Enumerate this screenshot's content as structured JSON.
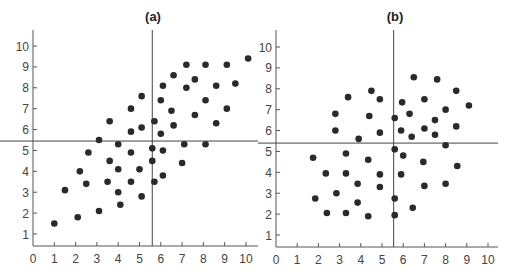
{
  "chart_data": [
    {
      "type": "scatter",
      "title": "(a)",
      "xlabel": "",
      "ylabel": "",
      "xlim": [
        0,
        10
      ],
      "ylim": [
        0.5,
        10.5
      ],
      "x_ticks": [
        0,
        1,
        2,
        3,
        4,
        5,
        6,
        7,
        8,
        9,
        10
      ],
      "y_ticks": [
        1,
        2,
        3,
        4,
        5,
        6,
        7,
        8,
        9,
        10
      ],
      "grid": false,
      "reference_lines": {
        "vertical_x": 5.6,
        "horizontal_y": 5.45
      },
      "marker_color": "#2a2a2a",
      "points": [
        [
          1.0,
          1.5
        ],
        [
          2.1,
          1.8
        ],
        [
          3.1,
          2.1
        ],
        [
          4.1,
          2.4
        ],
        [
          1.5,
          3.1
        ],
        [
          4.0,
          3.0
        ],
        [
          5.1,
          2.8
        ],
        [
          2.2,
          4.0
        ],
        [
          2.5,
          3.4
        ],
        [
          3.5,
          3.5
        ],
        [
          4.6,
          3.5
        ],
        [
          5.7,
          3.5
        ],
        [
          4.0,
          4.1
        ],
        [
          5.0,
          4.1
        ],
        [
          3.6,
          4.5
        ],
        [
          5.6,
          4.5
        ],
        [
          2.6,
          4.9
        ],
        [
          4.6,
          4.9
        ],
        [
          4.0,
          5.3
        ],
        [
          5.6,
          5.1
        ],
        [
          3.1,
          5.5
        ],
        [
          4.6,
          5.9
        ],
        [
          6.0,
          5.8
        ],
        [
          6.1,
          5.0
        ],
        [
          7.1,
          5.3
        ],
        [
          8.1,
          5.3
        ],
        [
          7.0,
          4.4
        ],
        [
          6.1,
          3.8
        ],
        [
          10.1,
          9.4
        ],
        [
          7.2,
          9.1
        ],
        [
          8.1,
          9.1
        ],
        [
          9.1,
          9.1
        ],
        [
          6.6,
          8.6
        ],
        [
          7.6,
          8.4
        ],
        [
          6.1,
          8.1
        ],
        [
          7.2,
          8.0
        ],
        [
          8.6,
          8.1
        ],
        [
          9.5,
          8.2
        ],
        [
          5.1,
          7.6
        ],
        [
          6.0,
          7.4
        ],
        [
          8.1,
          7.4
        ],
        [
          4.6,
          7.0
        ],
        [
          6.5,
          6.9
        ],
        [
          9.1,
          7.0
        ],
        [
          7.6,
          6.7
        ],
        [
          3.6,
          6.4
        ],
        [
          5.7,
          6.4
        ],
        [
          5.1,
          6.1
        ],
        [
          6.6,
          6.2
        ],
        [
          8.6,
          6.3
        ]
      ]
    },
    {
      "type": "scatter",
      "title": "(b)",
      "xlabel": "",
      "ylabel": "",
      "xlim": [
        0,
        10
      ],
      "ylim": [
        0.5,
        10.5
      ],
      "x_ticks": [
        0,
        1,
        2,
        3,
        4,
        5,
        6,
        7,
        8,
        9,
        10
      ],
      "y_ticks": [
        1,
        2,
        3,
        4,
        5,
        6,
        7,
        8,
        9,
        10
      ],
      "grid": false,
      "reference_lines": {
        "vertical_x": 5.55,
        "horizontal_y": 5.4
      },
      "marker_color": "#2a2a2a",
      "points": [
        [
          4.5,
          7.9
        ],
        [
          3.4,
          7.6
        ],
        [
          4.9,
          7.5
        ],
        [
          2.8,
          6.8
        ],
        [
          4.4,
          6.7
        ],
        [
          5.6,
          6.6
        ],
        [
          2.8,
          6.0
        ],
        [
          4.9,
          5.9
        ],
        [
          3.9,
          5.6
        ],
        [
          6.5,
          8.55
        ],
        [
          7.6,
          8.45
        ],
        [
          8.5,
          7.9
        ],
        [
          5.95,
          7.35
        ],
        [
          7.0,
          7.5
        ],
        [
          9.1,
          7.2
        ],
        [
          6.3,
          6.8
        ],
        [
          8.0,
          7.0
        ],
        [
          7.5,
          6.5
        ],
        [
          5.9,
          6.0
        ],
        [
          7.0,
          6.1
        ],
        [
          8.5,
          6.2
        ],
        [
          6.4,
          5.7
        ],
        [
          7.5,
          5.8
        ],
        [
          8.0,
          5.3
        ],
        [
          1.75,
          4.7
        ],
        [
          3.3,
          4.9
        ],
        [
          4.35,
          4.6
        ],
        [
          5.6,
          5.1
        ],
        [
          2.35,
          3.95
        ],
        [
          3.3,
          3.95
        ],
        [
          4.9,
          3.9
        ],
        [
          3.85,
          3.45
        ],
        [
          4.9,
          3.3
        ],
        [
          2.85,
          3.0
        ],
        [
          1.85,
          2.75
        ],
        [
          5.6,
          2.75
        ],
        [
          3.85,
          2.55
        ],
        [
          2.4,
          2.05
        ],
        [
          3.3,
          2.05
        ],
        [
          4.35,
          1.9
        ],
        [
          5.6,
          1.95
        ],
        [
          6.0,
          4.8
        ],
        [
          6.95,
          4.5
        ],
        [
          8.55,
          4.3
        ],
        [
          5.9,
          3.9
        ],
        [
          7.0,
          3.35
        ],
        [
          8.0,
          3.45
        ],
        [
          6.45,
          2.3
        ]
      ]
    }
  ]
}
